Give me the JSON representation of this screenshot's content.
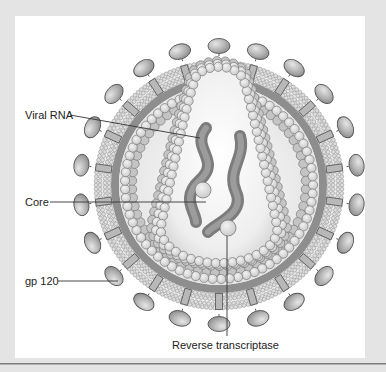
{
  "diagram": {
    "labels": [
      {
        "id": "viral-rna",
        "text": "Viral RNA",
        "x": 25,
        "y": 109,
        "line": [
          70,
          115,
          200,
          138
        ]
      },
      {
        "id": "core",
        "text": "Core",
        "x": 25,
        "y": 196,
        "line": [
          50,
          202,
          206,
          202
        ]
      },
      {
        "id": "gp120",
        "text": "gp 120",
        "x": 25,
        "y": 275,
        "line": [
          58,
          281,
          118,
          281
        ]
      },
      {
        "id": "reverse-transcriptase",
        "text": "Reverse transcriptase",
        "x": 172,
        "y": 339,
        "line": [
          227,
          336,
          227,
          236
        ]
      }
    ],
    "colors": {
      "page_background": "#e4e4e4",
      "panel": "#ffffff",
      "gp120_fill": "#a9a9a9",
      "gp120_stroke": "#555555",
      "lipid_head": "#dedede",
      "lipid_stroke": "#8a8a8a",
      "matrix_band": "#8e8e8e",
      "capsid_ball": "#dcdcdc",
      "capsid_stroke": "#7a7a7a",
      "rna": "#8a8a8a",
      "leader_line": "#333333"
    },
    "geometry": {
      "center": [
        219,
        185
      ],
      "gp120_radius": 139,
      "gp120_count": 22,
      "membrane_outer_radius": 125,
      "membrane_inner_radius": 108,
      "matrix_outer_radius": 108,
      "matrix_inner_radius": 100,
      "matrix_ball_radius": 94
    }
  }
}
